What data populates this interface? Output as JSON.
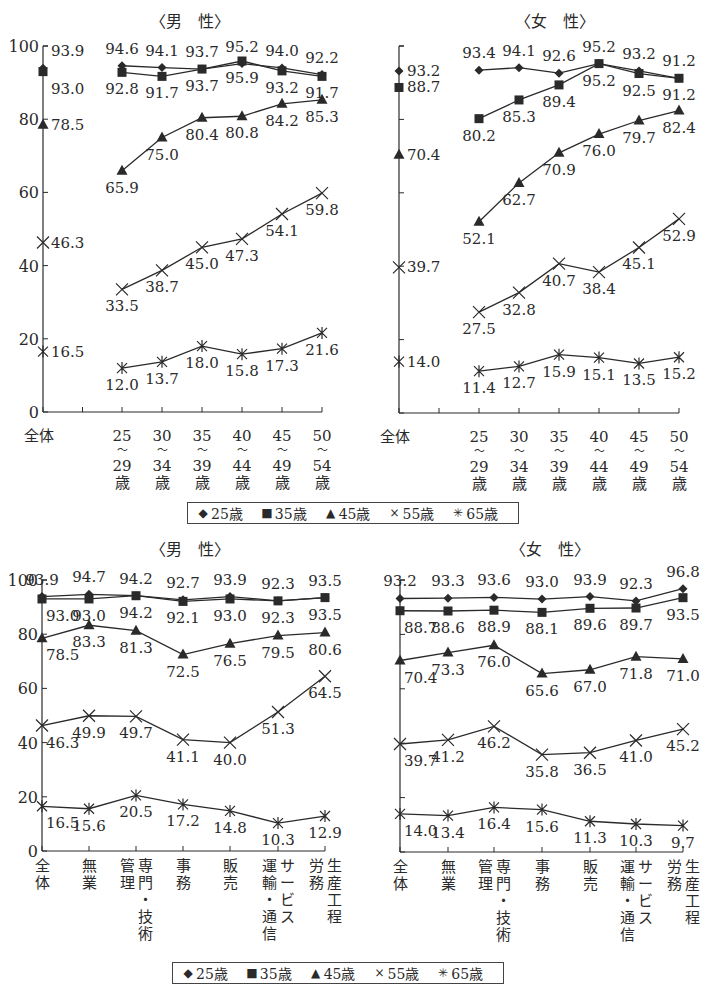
{
  "chart_data": [
    {
      "id": "age-male",
      "type": "line",
      "title": "〈男　性〉",
      "xlabel": "",
      "ylabel": "",
      "ylim": [
        0,
        100
      ],
      "yticks": [
        0,
        20,
        40,
        60,
        80,
        100
      ],
      "grid": false,
      "categories": [
        "全体",
        "25〜29歳",
        "30〜34歳",
        "35〜39歳",
        "40〜44歳",
        "45〜49歳",
        "50〜54歳"
      ],
      "category_labels": [
        [
          "全体"
        ],
        [
          "25",
          "〜",
          "29",
          "歳"
        ],
        [
          "30",
          "〜",
          "34",
          "歳"
        ],
        [
          "35",
          "〜",
          "39",
          "歳"
        ],
        [
          "40",
          "〜",
          "44",
          "歳"
        ],
        [
          "45",
          "〜",
          "49",
          "歳"
        ],
        [
          "50",
          "〜",
          "54",
          "歳"
        ]
      ],
      "series": [
        {
          "name": "25歳",
          "marker": "diamond",
          "overall": 93.9,
          "values": [
            94.6,
            94.1,
            93.7,
            95.2,
            94.0,
            92.2
          ]
        },
        {
          "name": "35歳",
          "marker": "square",
          "overall": 93.0,
          "values": [
            92.8,
            91.7,
            93.7,
            95.9,
            93.2,
            91.7
          ]
        },
        {
          "name": "45歳",
          "marker": "triangle",
          "overall": 78.5,
          "values": [
            65.9,
            75.0,
            80.4,
            80.8,
            84.2,
            85.3
          ]
        },
        {
          "name": "55歳",
          "marker": "cross",
          "overall": 46.3,
          "values": [
            33.5,
            38.7,
            45.0,
            47.3,
            54.1,
            59.8
          ]
        },
        {
          "name": "65歳",
          "marker": "asterisk",
          "overall": 16.5,
          "values": [
            12.0,
            13.7,
            18.0,
            15.8,
            17.3,
            21.6
          ]
        }
      ]
    },
    {
      "id": "age-female",
      "type": "line",
      "title": "〈女　性〉",
      "xlabel": "",
      "ylabel": "",
      "ylim": [
        0,
        100
      ],
      "yticks": [
        0,
        20,
        40,
        60,
        80,
        100
      ],
      "grid": false,
      "categories": [
        "全体",
        "25〜29歳",
        "30〜34歳",
        "35〜39歳",
        "40〜44歳",
        "45〜49歳",
        "50〜54歳"
      ],
      "category_labels": [
        [
          "全体"
        ],
        [
          "25",
          "〜",
          "29",
          "歳"
        ],
        [
          "30",
          "〜",
          "34",
          "歳"
        ],
        [
          "35",
          "〜",
          "39",
          "歳"
        ],
        [
          "40",
          "〜",
          "44",
          "歳"
        ],
        [
          "45",
          "〜",
          "49",
          "歳"
        ],
        [
          "50",
          "〜",
          "54",
          "歳"
        ]
      ],
      "series": [
        {
          "name": "25歳",
          "marker": "diamond",
          "overall": 93.2,
          "values": [
            93.4,
            94.1,
            92.6,
            95.2,
            93.2,
            91.2
          ]
        },
        {
          "name": "35歳",
          "marker": "square",
          "overall": 88.7,
          "values": [
            80.2,
            85.3,
            89.4,
            95.2,
            92.5,
            91.2
          ]
        },
        {
          "name": "45歳",
          "marker": "triangle",
          "overall": 70.4,
          "values": [
            52.1,
            62.7,
            70.9,
            76.0,
            79.7,
            82.4
          ]
        },
        {
          "name": "55歳",
          "marker": "cross",
          "overall": 39.7,
          "values": [
            27.5,
            32.8,
            40.7,
            38.4,
            45.1,
            52.9
          ]
        },
        {
          "name": "65歳",
          "marker": "asterisk",
          "overall": 14.0,
          "values": [
            11.4,
            12.7,
            15.9,
            15.1,
            13.5,
            15.2
          ]
        }
      ]
    },
    {
      "id": "occupation-male",
      "type": "line",
      "title": "〈男　性〉",
      "xlabel": "",
      "ylabel": "",
      "ylim": [
        0,
        100
      ],
      "yticks": [
        0,
        20,
        40,
        60,
        80,
        100
      ],
      "grid": false,
      "categories": [
        "全体",
        "無業",
        "管理",
        "専門・技術",
        "事務",
        "販売",
        "運輸・通信",
        "サービス",
        "労務",
        "生産工程"
      ],
      "x_groups": [
        "全体",
        "無業",
        "管理・専門・技術",
        "事務",
        "販売",
        "運輸・通信・サービス",
        "労務・生産工程"
      ],
      "category_labels": [
        [
          [
            "全体"
          ]
        ],
        [
          [
            "無業"
          ]
        ],
        [
          [
            "管理"
          ],
          [
            "専門・技術"
          ]
        ],
        [
          [
            "事務"
          ]
        ],
        [
          [
            "販売"
          ]
        ],
        [
          [
            "運輸・通信"
          ],
          [
            "サービス"
          ]
        ],
        [
          [
            "労務"
          ],
          [
            "生産工程"
          ]
        ]
      ],
      "series": [
        {
          "name": "25歳",
          "marker": "diamond",
          "values": [
            93.9,
            94.7,
            94.2,
            92.7,
            93.9,
            92.3,
            93.5
          ]
        },
        {
          "name": "35歳",
          "marker": "square",
          "values": [
            93.0,
            93.0,
            94.2,
            92.1,
            93.0,
            92.3,
            93.5
          ]
        },
        {
          "name": "45歳",
          "marker": "triangle",
          "values": [
            78.5,
            83.3,
            81.3,
            72.5,
            76.5,
            79.5,
            80.6
          ]
        },
        {
          "name": "55歳",
          "marker": "cross",
          "values": [
            46.3,
            49.9,
            49.7,
            41.1,
            40.0,
            51.3,
            64.5
          ]
        },
        {
          "name": "65歳",
          "marker": "asterisk",
          "values": [
            16.5,
            15.6,
            20.5,
            17.2,
            14.8,
            10.3,
            12.9
          ]
        }
      ]
    },
    {
      "id": "occupation-female",
      "type": "line",
      "title": "〈女　性〉",
      "xlabel": "",
      "ylabel": "",
      "ylim": [
        0,
        100
      ],
      "yticks": [
        0,
        20,
        40,
        60,
        80,
        100
      ],
      "grid": false,
      "categories": [
        "全体",
        "無業",
        "管理",
        "専門・技術",
        "事務",
        "販売",
        "運輸・通信",
        "サービス",
        "労務",
        "生産工程"
      ],
      "x_groups": [
        "全体",
        "無業",
        "管理・専門・技術",
        "事務",
        "販売",
        "運輸・通信・サービス",
        "労務・生産工程"
      ],
      "category_labels": [
        [
          [
            "全体"
          ]
        ],
        [
          [
            "無業"
          ]
        ],
        [
          [
            "管理"
          ],
          [
            "専門・技術"
          ]
        ],
        [
          [
            "事務"
          ]
        ],
        [
          [
            "販売"
          ]
        ],
        [
          [
            "運輸・通信"
          ],
          [
            "サービス"
          ]
        ],
        [
          [
            "労務"
          ],
          [
            "生産工程"
          ]
        ]
      ],
      "series": [
        {
          "name": "25歳",
          "marker": "diamond",
          "values": [
            93.2,
            93.3,
            93.6,
            93.0,
            93.9,
            92.3,
            96.8
          ]
        },
        {
          "name": "35歳",
          "marker": "square",
          "values": [
            88.7,
            88.6,
            88.9,
            88.1,
            89.6,
            89.7,
            93.5
          ]
        },
        {
          "name": "45歳",
          "marker": "triangle",
          "values": [
            70.4,
            73.3,
            76.0,
            65.6,
            67.0,
            71.8,
            71.0
          ]
        },
        {
          "name": "55歳",
          "marker": "cross",
          "values": [
            39.7,
            41.2,
            46.2,
            35.8,
            36.5,
            41.0,
            45.2
          ]
        },
        {
          "name": "65歳",
          "marker": "asterisk",
          "values": [
            14.0,
            13.4,
            16.4,
            15.6,
            11.3,
            10.3,
            9.7
          ]
        }
      ]
    }
  ],
  "legend": {
    "items": [
      {
        "symbol": "◆",
        "label": "25歳"
      },
      {
        "symbol": "■",
        "label": "35歳"
      },
      {
        "symbol": "▲",
        "label": "45歳"
      },
      {
        "symbol": "×",
        "label": "55歳"
      },
      {
        "symbol": "✳",
        "label": "65歳"
      }
    ]
  },
  "layout": {
    "panels": [
      {
        "title_x": 190,
        "title_y": 27,
        "axis_x": 43,
        "y0": 412,
        "y100": 46,
        "xs": [
          43,
          122,
          162,
          202,
          242,
          282,
          322
        ],
        "show_ytick_labels": true,
        "label_kind": "age",
        "data_labels": {
          "0": [
            [
              6,
              -7,
              "s"
            ],
            [
              6,
              12,
              "s"
            ]
          ],
          "series_label_pos": "age-male"
        }
      },
      {
        "title_x": 555,
        "title_y": 27,
        "axis_x": 399,
        "y0": 413,
        "y100": 46,
        "xs": [
          399,
          479,
          519,
          559,
          599,
          639,
          679
        ],
        "show_ytick_labels": false,
        "label_kind": "age"
      },
      {
        "title_x": 190,
        "title_y": 555,
        "axis_x": 42,
        "y0": 851,
        "y100": 580,
        "xs": [
          42,
          89,
          136,
          183,
          230,
          278,
          325
        ],
        "show_ytick_labels": true,
        "label_kind": "occ"
      },
      {
        "title_x": 550,
        "title_y": 555,
        "axis_x": 400,
        "y0": 852,
        "y100": 580,
        "xs": [
          400,
          448,
          494,
          542,
          590,
          636,
          683
        ],
        "show_ytick_labels": false,
        "label_kind": "occ"
      }
    ],
    "legends": [
      {
        "x": 187,
        "y": 502,
        "w": 332
      },
      {
        "x": 172,
        "y": 962,
        "w": 332
      }
    ]
  }
}
